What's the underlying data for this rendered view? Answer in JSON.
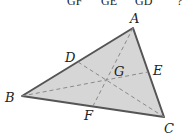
{
  "top_fragment": [
    "GF",
    "GE",
    "GD",
    "?"
  ],
  "diagram": {
    "vertices": {
      "A": "A",
      "B": "B",
      "C": "C"
    },
    "midpoints": {
      "D": "D",
      "E": "E",
      "F": "F"
    },
    "centroid": "G",
    "fill_color": "#d6d6d6",
    "edge_color": "#555555",
    "median_color": "#8a8a8a"
  }
}
